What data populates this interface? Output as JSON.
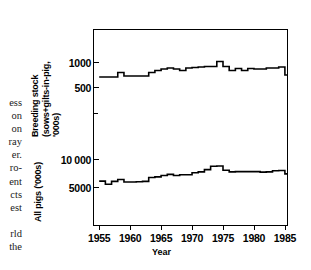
{
  "chart_data": {
    "type": "line",
    "title": "",
    "xlabel": "Year",
    "ylabel_top": "Breeding stock (sows+gilts-in-pig, '000s)",
    "ylabel_bottom": "All pigs ('000s)",
    "grid": false,
    "legend": "none",
    "step_style": "step-post",
    "xlim": [
      1954.0,
      1985.5
    ],
    "x_ticks": [
      "1955",
      "1960",
      "1965",
      "1970",
      "1975",
      "1980",
      "1985"
    ],
    "x_tick_values": [
      1955,
      1960,
      1965,
      1970,
      1975,
      1980,
      1985
    ],
    "axes": [
      {
        "name": "breeding-stock",
        "ylim": [
          0,
          1350
        ],
        "ticks_labeled": [
          {
            "value": 1000,
            "label": "1000"
          },
          {
            "value": 500,
            "label": "500"
          }
        ],
        "ticks_minor": [
          1350,
          250
        ]
      },
      {
        "name": "all-pigs",
        "ylim": [
          2000,
          13000
        ],
        "ticks_labeled": [
          {
            "value": 10000,
            "label": "10 000"
          },
          {
            "value": 5000,
            "label": "5000"
          }
        ],
        "ticks_minor": [
          12500,
          2800
        ]
      }
    ],
    "series": [
      {
        "name": "Breeding stock (sows+gilts-in-pig)",
        "units": "'000s",
        "axis": "breeding-stock",
        "x": [
          1955,
          1956,
          1957,
          1958,
          1959,
          1960,
          1961,
          1962,
          1963,
          1964,
          1965,
          1966,
          1967,
          1968,
          1969,
          1970,
          1971,
          1972,
          1973,
          1974,
          1975,
          1976,
          1977,
          1978,
          1979,
          1980,
          1981,
          1982,
          1983,
          1984,
          1985
        ],
        "values": [
          700,
          700,
          700,
          790,
          720,
          720,
          720,
          720,
          790,
          830,
          860,
          880,
          860,
          830,
          880,
          890,
          900,
          910,
          910,
          1010,
          910,
          830,
          870,
          830,
          870,
          860,
          860,
          880,
          880,
          900,
          740
        ]
      },
      {
        "name": "All pigs",
        "units": "'000s",
        "axis": "all-pigs",
        "x": [
          1955,
          1956,
          1957,
          1958,
          1959,
          1960,
          1961,
          1962,
          1963,
          1964,
          1965,
          1966,
          1967,
          1968,
          1969,
          1970,
          1971,
          1972,
          1973,
          1974,
          1975,
          1976,
          1977,
          1978,
          1979,
          1980,
          1981,
          1982,
          1983,
          1984,
          1985
        ],
        "values": [
          6050,
          5500,
          6000,
          6350,
          5900,
          5900,
          5950,
          6000,
          6700,
          6800,
          7050,
          7250,
          7050,
          7200,
          7200,
          7550,
          7700,
          8100,
          8700,
          8750,
          8000,
          7700,
          7750,
          7750,
          7750,
          7750,
          7650,
          7700,
          7900,
          7950,
          7350
        ]
      }
    ]
  },
  "side_column": {
    "fragments_top": [
      "ess",
      "on",
      "on",
      "ray",
      "er.",
      "ro-",
      "ent",
      "cts",
      "est"
    ],
    "fragments_bottom": [
      "rld",
      "the"
    ]
  },
  "axis_titles": {
    "breeding_line1": "Breeding stock",
    "breeding_line2": "(sows+gilts-in-pig,",
    "breeding_line3": "'000s)",
    "all_pigs": "All pigs ('000s)",
    "year": "Year"
  },
  "figure_caption": ""
}
